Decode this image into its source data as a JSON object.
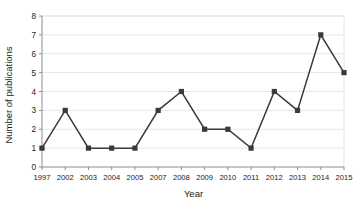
{
  "chart_data": {
    "type": "line",
    "title": "",
    "xlabel": "Year",
    "ylabel": "Number of publications",
    "categories": [
      "1997",
      "2002",
      "2003",
      "2004",
      "2005",
      "2007",
      "2008",
      "2009",
      "2010",
      "2011",
      "2012",
      "2013",
      "2014",
      "2015"
    ],
    "values": [
      1,
      3,
      1,
      1,
      1,
      3,
      4,
      2,
      2,
      1,
      4,
      3,
      7,
      5
    ],
    "series": [
      {
        "name": "Number of publications",
        "values": [
          1,
          3,
          1,
          1,
          1,
          3,
          4,
          2,
          2,
          1,
          4,
          3,
          7,
          5
        ]
      }
    ],
    "ylim": [
      0,
      8
    ],
    "yticks": [
      0,
      1,
      2,
      3,
      4,
      5,
      6,
      7,
      8
    ],
    "ytick_labels": [
      "0",
      "1",
      "2",
      "3",
      "4",
      "5",
      "6",
      "7",
      "8"
    ],
    "grid": "horizontal",
    "legend": "none",
    "marker": "square",
    "line_color": "#3a3a3a",
    "marker_color": "#3a3a3a",
    "grid_color": "#e6e6e6",
    "axis_color": "#8c8c8c",
    "background_color": "#ffffff"
  },
  "axes": {
    "y_title": "Number of publications",
    "x_title": "Year"
  }
}
